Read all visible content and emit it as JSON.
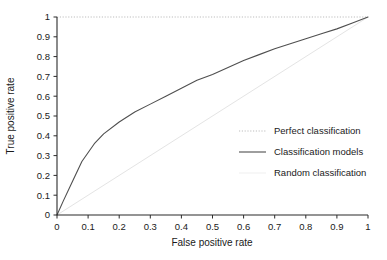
{
  "chart_data": {
    "type": "line",
    "title": "",
    "subtitle": "",
    "xlabel": "False positive rate",
    "ylabel": "True positive rate",
    "xlim": [
      0,
      1
    ],
    "ylim": [
      0,
      1
    ],
    "grid": false,
    "legend_position": "center-right",
    "xticks": [
      "0",
      "0.1",
      "0.2",
      "0.3",
      "0.4",
      "0.5",
      "0.6",
      "0.7",
      "0.8",
      "0.9",
      "1"
    ],
    "xtick_values": [
      0,
      0.1,
      0.2,
      0.3,
      0.4,
      0.5,
      0.6,
      0.7,
      0.8,
      0.9,
      1
    ],
    "yticks": [
      "0",
      "0.1",
      "0.2",
      "0.3",
      "0.4",
      "0.5",
      "0.6",
      "0.7",
      "0.8",
      "0.9",
      "1"
    ],
    "ytick_values": [
      0,
      0.1,
      0.2,
      0.3,
      0.4,
      0.5,
      0.6,
      0.7,
      0.8,
      0.9,
      1
    ],
    "series": [
      {
        "name": "Perfect classification",
        "style": "dotted",
        "color": "#b8b8b8",
        "x": [
          0,
          0.05,
          0.1,
          0.2,
          0.3,
          0.4,
          0.5,
          0.6,
          0.7,
          0.8,
          0.9,
          1
        ],
        "values": [
          1,
          1,
          1,
          1,
          1,
          1,
          1,
          1,
          1,
          1,
          1,
          1
        ]
      },
      {
        "name": "Classification models",
        "style": "solid",
        "color": "#4a4a4a",
        "x": [
          0,
          0.02,
          0.05,
          0.08,
          0.12,
          0.15,
          0.2,
          0.25,
          0.3,
          0.35,
          0.4,
          0.45,
          0.5,
          0.55,
          0.6,
          0.65,
          0.7,
          0.75,
          0.8,
          0.85,
          0.9,
          0.95,
          1
        ],
        "values": [
          0,
          0.07,
          0.17,
          0.27,
          0.36,
          0.41,
          0.47,
          0.52,
          0.56,
          0.6,
          0.64,
          0.68,
          0.71,
          0.745,
          0.78,
          0.81,
          0.84,
          0.865,
          0.89,
          0.915,
          0.94,
          0.97,
          1
        ]
      },
      {
        "name": "Random classification",
        "style": "solid-faint",
        "color": "#e2e2e2",
        "x": [
          0,
          1
        ],
        "values": [
          0,
          1
        ]
      }
    ]
  },
  "legend": {
    "entries": [
      {
        "label": "Perfect classification",
        "swatch": "dotted-line-swatch"
      },
      {
        "label": "Classification models",
        "swatch": "solid-line-swatch"
      },
      {
        "label": "Random classification",
        "swatch": "faint-line-swatch"
      }
    ]
  },
  "axes": {
    "x_title": "False positive rate",
    "y_title": "True positive rate"
  }
}
